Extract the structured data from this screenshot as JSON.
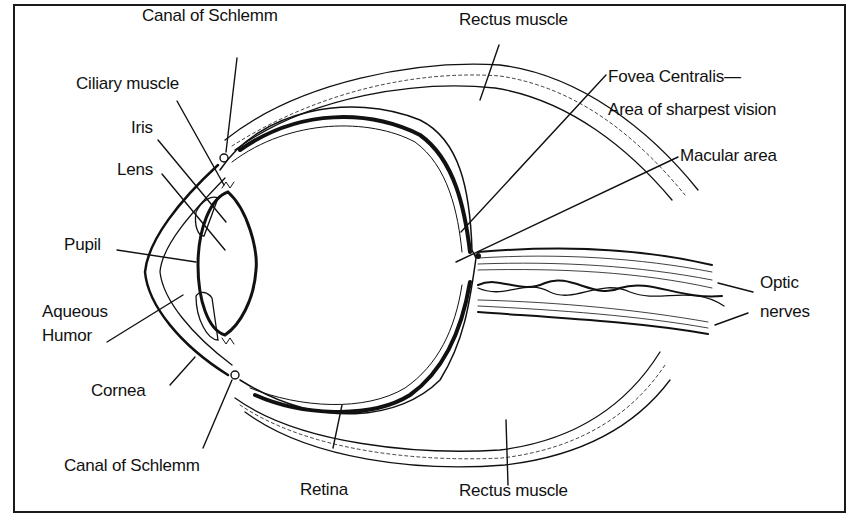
{
  "diagram": {
    "labels": {
      "canal_top": "Canal of Schlemm",
      "ciliary": "Ciliary muscle",
      "iris": "Iris",
      "lens": "Lens",
      "pupil": "Pupil",
      "aqueous_1": "Aqueous",
      "aqueous_2": "Humor",
      "cornea": "Cornea",
      "canal_bottom": "Canal of  Schlemm",
      "retina": "Retina",
      "rectus_top": "Rectus muscle",
      "rectus_bottom": "Rectus muscle",
      "fovea_1": "Fovea Centralis—",
      "fovea_2": "Area of sharpest vision",
      "macular": "Macular area",
      "optic_1": "Optic",
      "optic_2": "nerves"
    },
    "colors": {
      "line": "#111111",
      "background": "#ffffff",
      "border": "#1a1a1a"
    }
  }
}
